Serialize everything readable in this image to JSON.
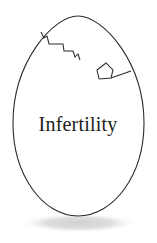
{
  "illustration": {
    "title": "Cracked egg with label",
    "background_color": "#ffffff",
    "egg": {
      "name": "egg-shape",
      "outline_color": "#2b2b2b",
      "fill_color": "#ffffff",
      "outline_width": 1.1,
      "center_x": 78,
      "bounds": {
        "left": 13,
        "right": 144,
        "top": 16,
        "bottom": 216
      }
    },
    "label": {
      "text": "Infertility",
      "color": "#1d1d1d",
      "x": 78,
      "y": 131,
      "font_size_px": 20
    },
    "cracks": [
      {
        "name": "upper-left-crack",
        "color": "#2b2b2b",
        "points": "41,32 44,38 47,36 49,44 63,44 64,51 73,51 75,57 78,54 80,60"
      },
      {
        "name": "upper-right-crack",
        "color": "#2b2b2b",
        "points": "99,79 97,70 106,63 113,70 111,78 99,79 131,71"
      }
    ],
    "shadow": {
      "name": "egg-shadow",
      "color": "#d5d5d5",
      "center_x": 79,
      "center_y": 223,
      "radius_x": 60,
      "radius_y": 10
    }
  }
}
